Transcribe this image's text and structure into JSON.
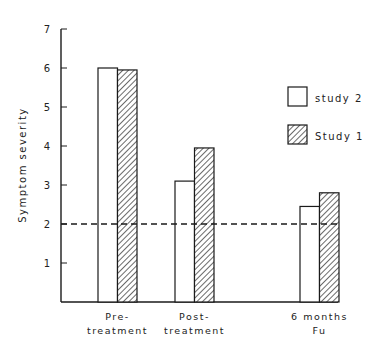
{
  "chart_data": {
    "type": "bar",
    "title": "",
    "xlabel": "",
    "ylabel": "Symptom severity",
    "ylim": [
      0,
      7
    ],
    "yticks": [
      1,
      2,
      3,
      4,
      5,
      6,
      7
    ],
    "categories": [
      "Pre-treatment",
      "Post-treatment",
      "6 months Fu"
    ],
    "category_labels": [
      [
        "Pre-",
        "treatment"
      ],
      [
        "Post-",
        "treatment"
      ],
      [
        "6 months",
        "Fu"
      ]
    ],
    "series": [
      {
        "name": "study 2",
        "style": "white",
        "values": [
          6.0,
          3.1,
          2.45
        ]
      },
      {
        "name": "Study 1",
        "style": "hatched",
        "values": [
          5.95,
          3.95,
          2.8
        ]
      }
    ],
    "reference_line": {
      "value": 2,
      "style": "dashed"
    },
    "legend_position": "right",
    "grid": false
  },
  "colors": {
    "ink": "#1a1a1a",
    "background": "#ffffff"
  }
}
